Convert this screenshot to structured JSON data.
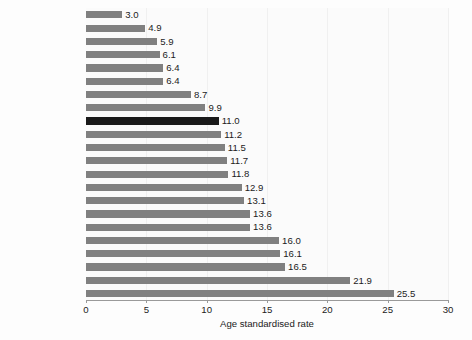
{
  "chart_data": {
    "type": "bar",
    "orientation": "horizontal",
    "title": "",
    "xlabel": "Age standardised rate",
    "ylabel": "",
    "xlim": [
      0,
      30
    ],
    "xticks": [
      0,
      5,
      10,
      15,
      20,
      25,
      30
    ],
    "grid": true,
    "legend": null,
    "highlight_category": "Scotland",
    "colors": {
      "bar": "#808080",
      "highlight_bar": "#1a1a1a",
      "background": "#fdfdfd",
      "gridline": "#f0f0f0",
      "axis": "#9a9a9a",
      "text": "#1b1b1b"
    },
    "categories": [
      "Greece",
      "Portugal",
      "England and Wales",
      "Italy (1995)",
      "United Kingdom",
      "Spain (1995)",
      "Netherlands",
      "Iceland (1995)",
      "Scotland",
      "Ireland (1996)",
      "Norway (1995)",
      "Germany",
      "Sweden (1996)",
      "Slovakia (1995)",
      "Poland (1996)",
      "Denmark (1996)",
      "Czech Republic",
      "France (1996)",
      "Austria",
      "Luxembourg",
      "Finland (1996)",
      "Hungary"
    ],
    "values": [
      3.0,
      4.9,
      5.9,
      6.1,
      6.4,
      6.4,
      8.7,
      9.9,
      11.0,
      11.2,
      11.5,
      11.7,
      11.8,
      12.9,
      13.1,
      13.6,
      13.6,
      16.0,
      16.1,
      16.5,
      21.9,
      25.5
    ],
    "value_labels": [
      "3.0",
      "4.9",
      "5.9",
      "6.1",
      "6.4",
      "6.4",
      "8.7",
      "9.9",
      "11.0",
      "11.2",
      "11.5",
      "11.7",
      "11.8",
      "12.9",
      "13.1",
      "13.6",
      "13.6",
      "16.0",
      "16.1",
      "16.5",
      "21.9",
      "25.5"
    ]
  }
}
